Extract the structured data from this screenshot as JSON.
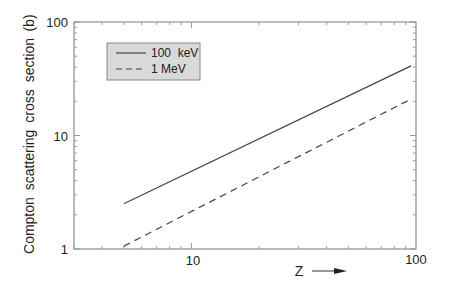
{
  "chart_data": {
    "type": "line",
    "title": "",
    "panel_label": "(b)",
    "xlabel": "Z",
    "ylabel": "Compton scattering cross section",
    "xscale": "log",
    "yscale": "log",
    "xlim": [
      3,
      100
    ],
    "ylim": [
      1,
      100
    ],
    "x_tick_labels": [
      "10",
      "100"
    ],
    "y_tick_labels": [
      "1",
      "10",
      "100"
    ],
    "grid": false,
    "legend_position": "upper left",
    "series": [
      {
        "name": "100  keV",
        "style": "solid",
        "x": [
          5,
          95
        ],
        "y": [
          2.5,
          41
        ]
      },
      {
        "name": "1 MeV",
        "style": "dashed",
        "x": [
          5,
          93
        ],
        "y": [
          1.06,
          20.5
        ]
      }
    ]
  },
  "labels": {
    "ylabel": "Compton scattering cross section",
    "panel": "(b)",
    "xlabel": "Z",
    "xtick_10": "10",
    "xtick_100": "100",
    "ytick_1": "1",
    "ytick_10": "10",
    "ytick_100": "100",
    "legend_solid": "100  keV",
    "legend_dashed": "1 MeV"
  },
  "colors": {
    "line": "#444444",
    "legend_fill": "#d9d9d9",
    "axis": "#666666"
  }
}
